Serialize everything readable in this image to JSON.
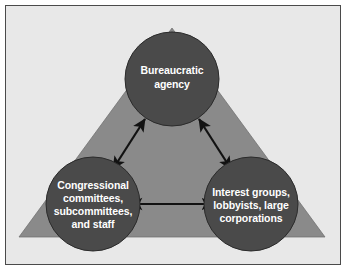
{
  "diagram": {
    "background_color": "#e8e8e8",
    "border_color": "#4a4a4a",
    "triangle": {
      "name": "iron-triangle",
      "fill_color": "#8a8a8a"
    },
    "nodes": [
      {
        "id": "bureaucratic-agency",
        "fill_color": "#4a4a4a",
        "text_color": "#ffffff",
        "lines": [
          "Bureaucratic",
          "agency"
        ]
      },
      {
        "id": "congressional-committees",
        "fill_color": "#4a4a4a",
        "text_color": "#ffffff",
        "lines": [
          "Congressional",
          "committees,",
          "subcommittees,",
          "and staff"
        ]
      },
      {
        "id": "interest-groups",
        "fill_color": "#4a4a4a",
        "text_color": "#ffffff",
        "lines": [
          "Interest groups,",
          "lobbyists, large",
          "corporations"
        ]
      }
    ],
    "connectors": [
      {
        "id": "congress-to-agency",
        "from": "congressional-committees",
        "to": "bureaucratic-agency",
        "style": "double-arrow",
        "color": "#121212"
      },
      {
        "id": "agency-to-interest-groups",
        "from": "bureaucratic-agency",
        "to": "interest-groups",
        "style": "double-arrow",
        "color": "#121212"
      },
      {
        "id": "congress-to-interest-groups",
        "from": "congressional-committees",
        "to": "interest-groups",
        "style": "double-arrow",
        "color": "#121212"
      }
    ]
  }
}
